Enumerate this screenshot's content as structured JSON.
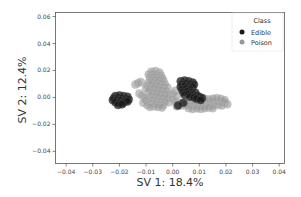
{
  "chart_data": {
    "type": "scatter",
    "title": "",
    "xlabel": "SV 1: 18.4%",
    "ylabel": "SV 2: 12.4%",
    "xlim": [
      -0.044,
      0.042
    ],
    "ylim": [
      -0.049,
      0.063
    ],
    "grid": false,
    "xticks": [
      -0.04,
      -0.03,
      -0.02,
      -0.01,
      0.0,
      0.01,
      0.02,
      0.03,
      0.04
    ],
    "xtick_labels": [
      "−0.04",
      "−0.03",
      "−0.02",
      "−0.01",
      "0.00",
      "0.01",
      "0.02",
      "0.03",
      "0.04"
    ],
    "yticks": [
      0.06,
      0.04,
      0.02,
      0.0,
      -0.02,
      -0.04
    ],
    "ytick_labels": [
      "0.06",
      "0.04",
      "0.02",
      "0.00",
      "−0.02",
      "−0.04"
    ],
    "legend": {
      "title": "Class",
      "position": "upper right",
      "entries": [
        {
          "label": "Edible",
          "color": "#1a1a1a"
        },
        {
          "label": "Poison",
          "color": "#999999"
        }
      ]
    },
    "series": [
      {
        "name": "Edible",
        "color": "#1a1a1a",
        "points": [
          [
            -0.0215,
            0.001
          ],
          [
            -0.02,
            0.0015
          ],
          [
            -0.0185,
            0.001
          ],
          [
            -0.017,
            0.0005
          ],
          [
            -0.022,
            -0.0005
          ],
          [
            -0.0205,
            -0.0002
          ],
          [
            -0.019,
            -0.0005
          ],
          [
            -0.0175,
            -0.001
          ],
          [
            -0.0225,
            -0.002
          ],
          [
            -0.021,
            -0.0018
          ],
          [
            -0.0195,
            -0.0022
          ],
          [
            -0.018,
            -0.0025
          ],
          [
            -0.0165,
            -0.0015
          ],
          [
            -0.0215,
            -0.0035
          ],
          [
            -0.02,
            -0.004
          ],
          [
            -0.0185,
            -0.0038
          ],
          [
            -0.017,
            -0.003
          ],
          [
            -0.0205,
            -0.0055
          ],
          [
            -0.019,
            -0.005
          ],
          [
            0.003,
            0.012
          ],
          [
            0.0045,
            0.0125
          ],
          [
            0.006,
            0.012
          ],
          [
            0.0075,
            0.011
          ],
          [
            0.0035,
            0.01
          ],
          [
            0.005,
            0.0105
          ],
          [
            0.0065,
            0.01
          ],
          [
            0.008,
            0.0095
          ],
          [
            0.003,
            0.008
          ],
          [
            0.0045,
            0.0085
          ],
          [
            0.006,
            0.008
          ],
          [
            0.0075,
            0.0078
          ],
          [
            0.0035,
            0.006
          ],
          [
            0.005,
            0.0065
          ],
          [
            0.0065,
            0.006
          ],
          [
            0.004,
            0.004
          ],
          [
            0.0055,
            0.0045
          ],
          [
            0.007,
            0.004
          ],
          [
            0.0085,
            0.0035
          ],
          [
            0.0045,
            0.002
          ],
          [
            0.006,
            0.0025
          ],
          [
            0.0075,
            0.002
          ],
          [
            0.009,
            0.0015
          ],
          [
            0.01,
            0.0005
          ],
          [
            0.011,
            -0.0005
          ],
          [
            0.0065,
            0.0005
          ],
          [
            0.008,
            0.0
          ],
          [
            0.009,
            -0.001
          ],
          [
            0.0105,
            -0.002
          ],
          [
            0.004,
            -0.004
          ],
          [
            0.002,
            -0.006
          ]
        ]
      },
      {
        "name": "Poison",
        "color": "#999999",
        "points": [
          [
            -0.008,
            0.019
          ],
          [
            -0.0065,
            0.0195
          ],
          [
            -0.005,
            0.0185
          ],
          [
            -0.009,
            0.017
          ],
          [
            -0.0075,
            0.0175
          ],
          [
            -0.006,
            0.017
          ],
          [
            -0.0045,
            0.0165
          ],
          [
            -0.0085,
            0.015
          ],
          [
            -0.007,
            0.0155
          ],
          [
            -0.0055,
            0.015
          ],
          [
            -0.004,
            0.0145
          ],
          [
            -0.008,
            0.013
          ],
          [
            -0.0065,
            0.0135
          ],
          [
            -0.005,
            0.013
          ],
          [
            -0.0035,
            0.0125
          ],
          [
            -0.009,
            0.011
          ],
          [
            -0.0075,
            0.0115
          ],
          [
            -0.006,
            0.011
          ],
          [
            -0.0045,
            0.0105
          ],
          [
            -0.003,
            0.01
          ],
          [
            -0.0095,
            0.009
          ],
          [
            -0.008,
            0.0095
          ],
          [
            -0.0065,
            0.009
          ],
          [
            -0.005,
            0.0085
          ],
          [
            -0.0035,
            0.008
          ],
          [
            -0.002,
            0.0075
          ],
          [
            -0.01,
            0.007
          ],
          [
            -0.0085,
            0.0065
          ],
          [
            -0.007,
            0.007
          ],
          [
            -0.0055,
            0.006
          ],
          [
            -0.004,
            0.0055
          ],
          [
            -0.0025,
            0.005
          ],
          [
            -0.009,
            0.0045
          ],
          [
            -0.0075,
            0.004
          ],
          [
            -0.006,
            0.0035
          ],
          [
            -0.0045,
            0.003
          ],
          [
            -0.003,
            0.0025
          ],
          [
            -0.0015,
            0.002
          ],
          [
            -0.008,
            0.0015
          ],
          [
            -0.0065,
            0.001
          ],
          [
            -0.005,
            0.0005
          ],
          [
            -0.0035,
            0.0
          ],
          [
            -0.002,
            -0.0005
          ],
          [
            -0.009,
            -0.001
          ],
          [
            -0.0075,
            -0.0015
          ],
          [
            -0.006,
            -0.002
          ],
          [
            -0.0045,
            -0.0025
          ],
          [
            -0.003,
            -0.003
          ],
          [
            -0.0015,
            -0.0035
          ],
          [
            -0.008,
            -0.004
          ],
          [
            -0.0065,
            -0.0045
          ],
          [
            -0.005,
            -0.005
          ],
          [
            -0.0035,
            -0.0055
          ],
          [
            -0.007,
            -0.0065
          ],
          [
            -0.0055,
            -0.007
          ],
          [
            -0.004,
            -0.0075
          ],
          [
            -0.014,
            0.0095
          ],
          [
            -0.013,
            0.0105
          ],
          [
            -0.012,
            0.0115
          ],
          [
            -0.0125,
            0.003
          ],
          [
            -0.0115,
            0.0015
          ],
          [
            -0.0105,
            0.0
          ],
          [
            -0.01,
            -0.002
          ],
          [
            -0.011,
            -0.004
          ],
          [
            -0.0095,
            -0.0055
          ],
          [
            -0.0085,
            -0.007
          ],
          [
            0.001,
            0.005
          ],
          [
            0.0,
            0.003
          ],
          [
            0.0015,
            0.001
          ],
          [
            0.0,
            -0.001
          ],
          [
            0.001,
            -0.003
          ],
          [
            0.0025,
            -0.0045
          ],
          [
            0.0015,
            -0.0065
          ],
          [
            0.0035,
            -0.006
          ],
          [
            0.005,
            -0.003
          ],
          [
            0.0065,
            -0.004
          ],
          [
            0.008,
            -0.0035
          ],
          [
            0.0095,
            -0.004
          ],
          [
            0.011,
            -0.0045
          ],
          [
            0.0125,
            -0.004
          ],
          [
            0.014,
            -0.0035
          ],
          [
            0.0155,
            -0.003
          ],
          [
            0.017,
            -0.0025
          ],
          [
            0.0185,
            -0.003
          ],
          [
            0.0195,
            -0.004
          ],
          [
            0.0205,
            -0.005
          ],
          [
            0.005,
            -0.0055
          ],
          [
            0.0065,
            -0.006
          ],
          [
            0.008,
            -0.0055
          ],
          [
            0.0095,
            -0.006
          ],
          [
            0.011,
            -0.0065
          ],
          [
            0.0125,
            -0.006
          ],
          [
            0.014,
            -0.0055
          ],
          [
            0.0155,
            -0.006
          ],
          [
            0.017,
            -0.0055
          ],
          [
            0.0185,
            -0.006
          ],
          [
            0.006,
            -0.008
          ],
          [
            0.0075,
            -0.0085
          ],
          [
            0.009,
            -0.008
          ],
          [
            0.0105,
            -0.0085
          ],
          [
            0.012,
            -0.008
          ],
          [
            0.0135,
            -0.0075
          ],
          [
            0.015,
            -0.008
          ],
          [
            0.012,
            -0.001
          ],
          [
            0.0135,
            -0.0015
          ],
          [
            0.015,
            -0.001
          ],
          [
            0.0165,
            -0.0005
          ],
          [
            0.018,
            -0.001
          ],
          [
            0.0195,
            -0.002
          ]
        ]
      }
    ]
  }
}
